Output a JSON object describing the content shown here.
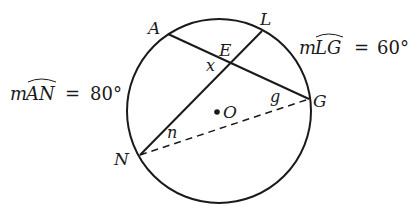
{
  "diagram": {
    "type": "circle-geometry",
    "circle": {
      "center_label": "O",
      "cx": 219,
      "cy": 111,
      "r": 92
    },
    "points": {
      "A": {
        "label": "A",
        "x": 168,
        "y": 34
      },
      "L": {
        "label": "L",
        "x": 262,
        "y": 31
      },
      "G": {
        "label": "G",
        "x": 309,
        "y": 99
      },
      "N": {
        "label": "N",
        "x": 140,
        "y": 155
      },
      "E": {
        "label": "E",
        "x": 231,
        "y": 62
      },
      "O": {
        "label": "O",
        "x": 217,
        "y": 112
      }
    },
    "segments": [
      {
        "from": "A",
        "to": "G",
        "style": "solid"
      },
      {
        "from": "L",
        "to": "N",
        "style": "solid"
      },
      {
        "from": "N",
        "to": "G",
        "style": "dashed"
      }
    ],
    "angle_labels": {
      "x": "x",
      "g": "g",
      "n": "n"
    },
    "arc_measures": {
      "AN": {
        "prefix": "m",
        "arc": "AN",
        "equals": "=",
        "value": "80°"
      },
      "LG": {
        "prefix": "m",
        "arc": "LG",
        "equals": "=",
        "value": "60°"
      }
    }
  }
}
